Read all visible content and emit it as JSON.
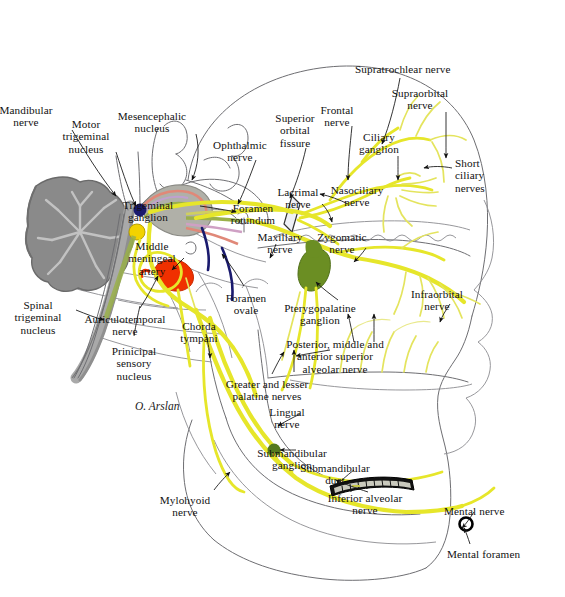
{
  "figure": {
    "signature": "O. Arslan",
    "colors": {
      "nerve_yellow": "#e6e62a",
      "nerve_yellow_light": "#e9e97d",
      "ganglion_green": "#6b8e23",
      "ganglion_gray": "#b0b0a8",
      "artery_red": "#f03000",
      "circle_navy": "#1a1a6e",
      "circle_yellow": "#f2d200",
      "brain_gray": "#8a8a8a",
      "bone_outline": "#6e6e72",
      "leader_black": "#111111"
    }
  },
  "labels": [
    {
      "id": "mandibular-nerve",
      "text": "Mandibular\nnerve",
      "x": 26,
      "y": 104,
      "align": "center"
    },
    {
      "id": "motor-trigeminal-nucleus",
      "text": "Motor\ntrigeminal\nnucleus",
      "x": 86,
      "y": 118,
      "align": "center"
    },
    {
      "id": "mesencephalic-nucleus",
      "text": "Mesencephalic\nnucleus",
      "x": 152,
      "y": 110,
      "align": "center"
    },
    {
      "id": "ophthalmic-nerve",
      "text": "Ophthalmic\nnerve",
      "x": 240,
      "y": 139,
      "align": "center"
    },
    {
      "id": "superior-orbital-fissure",
      "text": "Superior\norbital\nfissure",
      "x": 295,
      "y": 112,
      "align": "center"
    },
    {
      "id": "frontal-nerve",
      "text": "Frontal\nnerve",
      "x": 337,
      "y": 104,
      "align": "center"
    },
    {
      "id": "supratrochlear-nerve",
      "text": "Supratrochlear nerve",
      "x": 355,
      "y": 63,
      "align": "left"
    },
    {
      "id": "supraorbital-nerve",
      "text": "Supraorbital\nnerve",
      "x": 420,
      "y": 87,
      "align": "center"
    },
    {
      "id": "ciliary-ganglion",
      "text": "Ciliary\nganglion",
      "x": 379,
      "y": 131,
      "align": "center"
    },
    {
      "id": "short-ciliary-nerves",
      "text": "Short\nciliary\nnerves",
      "x": 455,
      "y": 157,
      "align": "left"
    },
    {
      "id": "nasociliary-nerve",
      "text": "Nasociliary\nnerve",
      "x": 357,
      "y": 184,
      "align": "center"
    },
    {
      "id": "lacrimal-nerve",
      "text": "Lacrimal\nnerve",
      "x": 298,
      "y": 186,
      "align": "center"
    },
    {
      "id": "foramen-rotundum",
      "text": "Foramen\nrotundum",
      "x": 253,
      "y": 202,
      "align": "center"
    },
    {
      "id": "trigeminal-ganglion",
      "text": "Trigeminal\nganglion",
      "x": 148,
      "y": 199,
      "align": "center"
    },
    {
      "id": "maxillary-nerve",
      "text": "Maxillary\nnerve",
      "x": 280,
      "y": 231,
      "align": "center"
    },
    {
      "id": "zygomatic-nerve",
      "text": "Zygomatic\nnerve",
      "x": 342,
      "y": 231,
      "align": "center"
    },
    {
      "id": "middle-meningeal-artery",
      "text": "Middle\nmeningeal\nartery",
      "x": 152,
      "y": 240,
      "align": "center"
    },
    {
      "id": "spinal-trigeminal-nucleus",
      "text": "Spinal\ntrigeminal\nnucleus",
      "x": 38,
      "y": 299,
      "align": "center"
    },
    {
      "id": "auriculotemporal-nerve",
      "text": "Auriculotemporal\nnerve",
      "x": 125,
      "y": 313,
      "align": "center"
    },
    {
      "id": "chorda-tympani",
      "text": "Chorda\ntympani",
      "x": 199,
      "y": 320,
      "align": "center"
    },
    {
      "id": "foramen-ovale",
      "text": "Foramen\novale",
      "x": 246,
      "y": 292,
      "align": "center"
    },
    {
      "id": "pterygopalatine-ganglion",
      "text": "Pterygopalatine\nganglion",
      "x": 320,
      "y": 302,
      "align": "center"
    },
    {
      "id": "posterior-middle-anterior-superior-alveolar-nerve",
      "text": "Posterior, middle and\nanterior superior\nalveolar nerve",
      "x": 335,
      "y": 338,
      "align": "center"
    },
    {
      "id": "infraorbital-nerve",
      "text": "Infraorbital\nnerve",
      "x": 437,
      "y": 288,
      "align": "center"
    },
    {
      "id": "prinicipal-sensory-nucleus",
      "text": "Prinicipal\nsensory\nnucleus",
      "x": 134,
      "y": 345,
      "align": "center"
    },
    {
      "id": "greater-and-lesser-palatine-nerves",
      "text": "Greater and lesser\npalatine nerves",
      "x": 267,
      "y": 378,
      "align": "center"
    },
    {
      "id": "lingual-nerve",
      "text": "Lingual\nnerve",
      "x": 287,
      "y": 406,
      "align": "center"
    },
    {
      "id": "submandibular-ganglion",
      "text": "Submandibular\nganglion",
      "x": 292,
      "y": 447,
      "align": "center"
    },
    {
      "id": "submandibular-duct",
      "text": "Submandibular\nduct",
      "x": 335,
      "y": 462,
      "align": "center"
    },
    {
      "id": "inferior-alveolar-nerve",
      "text": "Inferior alveolar\nnerve",
      "x": 365,
      "y": 492,
      "align": "center"
    },
    {
      "id": "mental-nerve",
      "text": "Mental nerve",
      "x": 444,
      "y": 505,
      "align": "left"
    },
    {
      "id": "mental-foramen",
      "text": "Mental foramen",
      "x": 447,
      "y": 548,
      "align": "left"
    },
    {
      "id": "mylohyoid-nerve",
      "text": "Mylohyoid\nnerve",
      "x": 185,
      "y": 494,
      "align": "center"
    }
  ],
  "structures": [
    {
      "id": "cerebellum",
      "name": "brainstem-cerebellum",
      "color": "#8a8a8a"
    },
    {
      "id": "trigeminal-ganglion-body",
      "name": "trigeminal-ganglion",
      "color": "#b0b0a8"
    },
    {
      "id": "ciliary-ganglion-dot",
      "name": "ciliary-ganglion",
      "color": "#6b8e23"
    },
    {
      "id": "pterygopalatine-body",
      "name": "pterygopalatine-ganglion",
      "color": "#6b8e23"
    },
    {
      "id": "submandibular-dot",
      "name": "submandibular-ganglion",
      "color": "#557a1e"
    },
    {
      "id": "meningeal-artery-blob",
      "name": "middle-meningeal-artery",
      "color": "#f03000"
    },
    {
      "id": "mental-foramen-ring",
      "name": "mental-foramen",
      "color": "#000000"
    },
    {
      "id": "submandibular-duct-body",
      "name": "submandibular-duct",
      "color": "#111111"
    }
  ]
}
